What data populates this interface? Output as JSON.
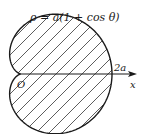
{
  "diagram": {
    "equation": "ρ = a(1 + cos θ)",
    "origin_label": "O",
    "point_label": "2a",
    "axis_label": "x",
    "curve": "cardioid",
    "fill_pattern": "diagonal-hatch",
    "stroke_color": "#1a1a1a",
    "background": "#ffffff"
  }
}
